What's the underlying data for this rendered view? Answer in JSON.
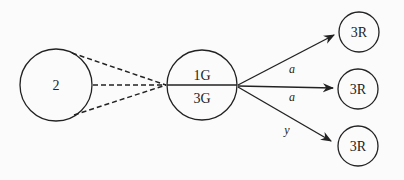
{
  "diagram": {
    "colors": {
      "stroke": "#222222",
      "background": "#fbfbfb"
    },
    "nodes": [
      {
        "id": "left",
        "label": "2"
      },
      {
        "id": "center",
        "label_top": "1G",
        "label_bottom": "3G"
      },
      {
        "id": "right1",
        "label": "3R"
      },
      {
        "id": "right2",
        "label": "3R"
      },
      {
        "id": "right3",
        "label": "3R"
      }
    ],
    "edges": [
      {
        "from": "left",
        "to": "center",
        "style": "dashed",
        "label": ""
      },
      {
        "from": "left",
        "to": "center",
        "style": "dashed",
        "label": ""
      },
      {
        "from": "left",
        "to": "center",
        "style": "dashed",
        "label": ""
      },
      {
        "from": "center",
        "to": "right1",
        "style": "solid-arrow",
        "label": "a"
      },
      {
        "from": "center",
        "to": "right2",
        "style": "solid-arrow",
        "label": "a"
      },
      {
        "from": "center",
        "to": "right3",
        "style": "solid-arrow",
        "label": "y"
      }
    ]
  }
}
